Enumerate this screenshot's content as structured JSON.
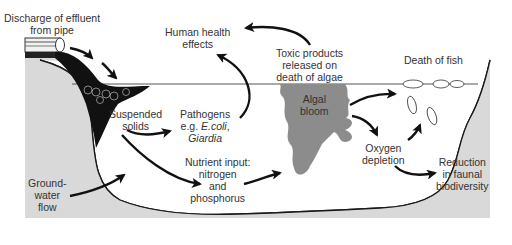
{
  "colors": {
    "ground": "#d9d9d9",
    "water": "#ffffff",
    "effluent": "#111111",
    "algal_bloom": "#8c8c8c",
    "outline": "#1a1a1a",
    "text": "#333333"
  },
  "labels": {
    "discharge": [
      "Discharge of effluent",
      "from pipe"
    ],
    "human_health": [
      "Human health",
      "effects"
    ],
    "toxic_products": [
      "Toxic products",
      "released on",
      "death of algae"
    ],
    "death_of_fish": "Death of fish",
    "suspended_solids": [
      "Suspended",
      "solids"
    ],
    "pathogens": [
      "Pathogens",
      "e.g. ",
      "E.coli",
      ",",
      "Giardia"
    ],
    "algal_bloom": [
      "Algal",
      "bloom"
    ],
    "oxygen_depletion": [
      "Oxygen",
      "depletion"
    ],
    "nutrient_input": [
      "Nutrient input:",
      "nitrogen",
      "and",
      "phosphorus"
    ],
    "groundwater": [
      "Ground-",
      "water",
      "flow"
    ],
    "reduction": [
      "Reduction",
      "in faunal",
      "biodiversity"
    ]
  },
  "arrows": [
    {
      "from": "pipe",
      "to": "water surface"
    },
    {
      "from": "suspended_solids",
      "to": "pathogens"
    },
    {
      "from": "suspended_solids",
      "to": "nutrient_input"
    },
    {
      "from": "pathogens",
      "to": "human_health"
    },
    {
      "from": "toxic_products",
      "to": "human_health"
    },
    {
      "from": "nutrient_input",
      "to": "algal_bloom"
    },
    {
      "from": "algal_bloom",
      "to": "death_of_fish"
    },
    {
      "from": "algal_bloom",
      "to": "oxygen_depletion"
    },
    {
      "from": "oxygen_depletion",
      "to": "death_of_fish"
    },
    {
      "from": "oxygen_depletion",
      "to": "reduction"
    },
    {
      "from": "groundwater",
      "to": "water body"
    }
  ]
}
